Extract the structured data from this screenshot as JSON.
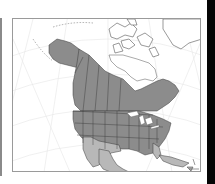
{
  "figure": {
    "type": "species-range-map",
    "region": "North America",
    "projection": "conic (lat/long graticule)",
    "colors": {
      "background": "#ffffff",
      "frame_border": "#9a9a9a",
      "graticule": "#e6e6e6",
      "range_dark": "#8c8c8c",
      "range_light": "#b8b8b8",
      "non_range_land": "#ffffff",
      "boundaries": "#3a3a3a",
      "coastline": "#555555",
      "right_edge_bar": "#050505",
      "left_edge_bar": "#8a8a8a"
    },
    "legend": null,
    "range_description": {
      "dark_shading": "Alaska, western and central Canada, eastern Canada (Quebec/Labrador), most of the contiguous United States",
      "light_shading": "US Southwest, Texas, Mexico, Florida, Cuba and Caribbean islands",
      "unshaded": "Canadian Arctic archipelago, Nunavut, Greenland, northern Quebec (Ungava)"
    }
  }
}
